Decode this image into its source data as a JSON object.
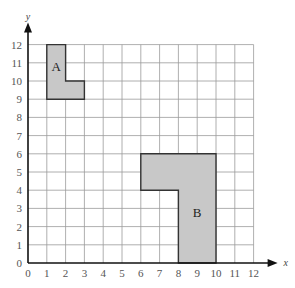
{
  "diagram": {
    "type": "coordinate-grid",
    "x_axis": {
      "label": "x",
      "min": 0,
      "max": 12,
      "ticks": [
        "0",
        "1",
        "2",
        "3",
        "4",
        "5",
        "6",
        "7",
        "8",
        "9",
        "10",
        "11",
        "12"
      ]
    },
    "y_axis": {
      "label": "y",
      "min": 0,
      "max": 12,
      "ticks": [
        "0",
        "1",
        "2",
        "3",
        "4",
        "5",
        "6",
        "7",
        "8",
        "9",
        "10",
        "11",
        "12"
      ]
    },
    "shapes": [
      {
        "label": "A",
        "fill": "#c8c8c8",
        "stroke": "#333333",
        "vertices": [
          [
            1,
            9
          ],
          [
            1,
            12
          ],
          [
            2,
            12
          ],
          [
            2,
            10
          ],
          [
            3,
            10
          ],
          [
            3,
            9
          ]
        ],
        "label_pos": [
          1.5,
          10.7
        ]
      },
      {
        "label": "B",
        "fill": "#c8c8c8",
        "stroke": "#333333",
        "vertices": [
          [
            6,
            4
          ],
          [
            6,
            6
          ],
          [
            10,
            6
          ],
          [
            10,
            0
          ],
          [
            8,
            0
          ],
          [
            8,
            4
          ]
        ],
        "label_pos": [
          9,
          2.7
        ]
      }
    ],
    "grid_color": "#9a9a9a",
    "axis_color": "#111111"
  }
}
